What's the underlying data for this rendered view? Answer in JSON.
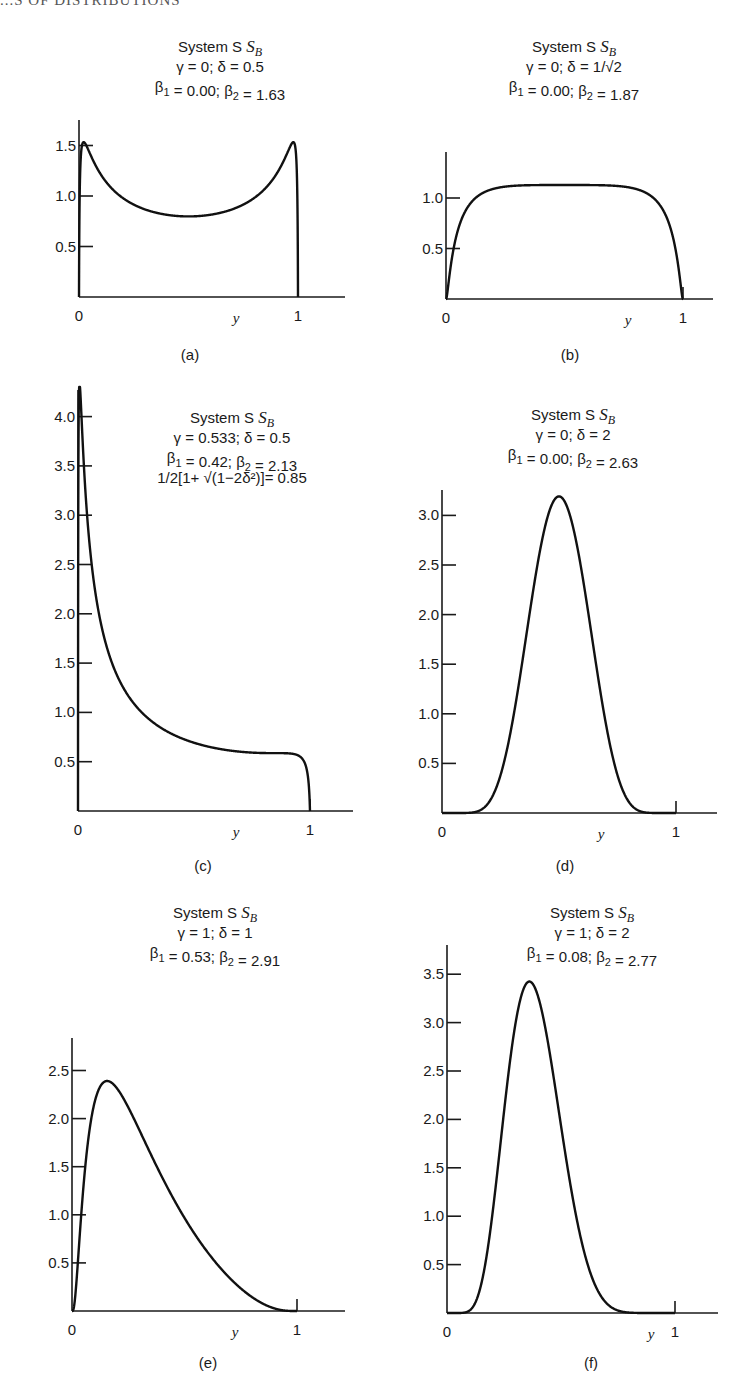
{
  "page": {
    "header_fragment": "...S OF DISTRIBUTIONS",
    "footer_fragment": ""
  },
  "chart_data": [
    {
      "id": "a",
      "type": "line",
      "caption": "(a)",
      "title": "System S_B",
      "title_lines": [
        "System S",
        "γ = 0; δ = 0.5",
        "β1 = 0.00; β2 = 1.63"
      ],
      "params": {
        "gamma": 0,
        "delta": 0.5,
        "beta1": 0.0,
        "beta2": 1.63
      },
      "xlabel": "y",
      "ylabel": "",
      "xlim": [
        0,
        1
      ],
      "ylim": [
        0,
        1.65
      ],
      "x_ticks": [
        "0",
        "1"
      ],
      "y_ticks": [
        0.5,
        1.0,
        1.5
      ],
      "y_tick_labels": [
        "0.5",
        "1.0",
        "1.5"
      ],
      "x": [
        0.1,
        0.2,
        0.3,
        0.4,
        0.5,
        0.6,
        0.7,
        0.8,
        0.9
      ],
      "values": [
        1.21,
        0.98,
        0.87,
        0.81,
        0.8,
        0.81,
        0.87,
        0.98,
        1.21
      ],
      "peak_values": [
        1.57,
        1.57
      ],
      "grid": false,
      "legend": null
    },
    {
      "id": "b",
      "type": "line",
      "caption": "(b)",
      "title": "System S_B",
      "title_lines": [
        "System S",
        "γ = 0; δ = 1/√2",
        "β1 = 0.00; β2 = 1.87"
      ],
      "params": {
        "gamma": 0,
        "delta": 0.7071,
        "beta1": 0.0,
        "beta2": 1.87
      },
      "xlabel": "y",
      "ylabel": "",
      "xlim": [
        0,
        1
      ],
      "ylim": [
        0,
        1.45
      ],
      "x_ticks": [
        "0",
        "1"
      ],
      "y_ticks": [
        0.5,
        1.0
      ],
      "y_tick_labels": [
        "0.5",
        "1.0"
      ],
      "x": [
        0.1,
        0.2,
        0.3,
        0.4,
        0.5,
        0.6,
        0.7,
        0.8,
        0.9
      ],
      "values": [
        0.94,
        1.09,
        1.12,
        1.13,
        1.13,
        1.13,
        1.12,
        1.09,
        0.94
      ],
      "grid": false,
      "legend": null
    },
    {
      "id": "c",
      "type": "line",
      "caption": "(c)",
      "title": "System S_B",
      "title_lines": [
        "System S",
        "γ = 0.533; δ = 0.5",
        "β1 = 0.42; β2 = 2.13",
        "1/2[1+ √(1−2δ²)]= 0.85"
      ],
      "params": {
        "gamma": 0.533,
        "delta": 0.5,
        "beta1": 0.42,
        "beta2": 2.13,
        "mode_expr": "1/2[1+ √(1−2δ²)]",
        "mode_value": 0.85
      },
      "xlabel": "y",
      "ylabel": "",
      "xlim": [
        0,
        1
      ],
      "ylim": [
        0,
        4.3
      ],
      "x_ticks": [
        "0",
        "1"
      ],
      "y_ticks": [
        0.5,
        1.0,
        1.5,
        2.0,
        2.5,
        3.0,
        3.5,
        4.0
      ],
      "y_tick_labels": [
        "0.5",
        "1.0",
        "1.5",
        "2.0",
        "2.5",
        "3.0",
        "3.5",
        "4.0"
      ],
      "x": [
        0.1,
        0.2,
        0.3,
        0.4,
        0.5,
        0.6,
        0.7,
        0.8,
        0.9
      ],
      "values": [
        1.89,
        1.23,
        0.94,
        0.79,
        0.69,
        0.63,
        0.6,
        0.59,
        0.57
      ],
      "peak": {
        "x": 0.04,
        "y": 4.03
      },
      "grid": false,
      "legend": null
    },
    {
      "id": "d",
      "type": "line",
      "caption": "(d)",
      "title": "System S_B",
      "title_lines": [
        "System S",
        "γ = 0; δ =  2",
        "β1 = 0.00; β2 = 2.63"
      ],
      "params": {
        "gamma": 0,
        "delta": 2,
        "beta1": 0.0,
        "beta2": 2.63
      },
      "xlabel": "y",
      "ylabel": "",
      "xlim": [
        0,
        1
      ],
      "ylim": [
        0,
        3.3
      ],
      "x_ticks": [
        "0",
        "1"
      ],
      "y_ticks": [
        0.5,
        1.0,
        1.5,
        2.0,
        2.5,
        3.0
      ],
      "y_tick_labels": [
        "0.5",
        "1.0",
        "1.5",
        "2.0",
        "2.5",
        "3.0"
      ],
      "x": [
        0.1,
        0.2,
        0.3,
        0.4,
        0.5,
        0.6,
        0.7,
        0.8,
        0.9
      ],
      "values": [
        0.0,
        0.11,
        0.9,
        2.39,
        3.19,
        2.39,
        0.9,
        0.11,
        0.0
      ],
      "peak": {
        "x": 0.5,
        "y": 3.19
      },
      "grid": false,
      "legend": null
    },
    {
      "id": "e",
      "type": "line",
      "caption": "(e)",
      "title": "System S_B",
      "title_lines": [
        "System S",
        "γ = 1; δ = 1",
        "β1 = 0.53; β2 = 2.91"
      ],
      "params": {
        "gamma": 1,
        "delta": 1,
        "beta1": 0.53,
        "beta2": 2.91
      },
      "xlabel": "y",
      "ylabel": "",
      "xlim": [
        0,
        1
      ],
      "ylim": [
        0,
        2.85
      ],
      "x_ticks": [
        "0",
        "1"
      ],
      "y_ticks": [
        0.5,
        1.0,
        1.5,
        2.0,
        2.5
      ],
      "y_tick_labels": [
        "0.5",
        "1.0",
        "1.5",
        "2.0",
        "2.5"
      ],
      "x": [
        0.1,
        0.2,
        0.3,
        0.4,
        0.5,
        0.6,
        0.7,
        0.8,
        0.9
      ],
      "values": [
        2.16,
        2.31,
        1.88,
        1.39,
        0.97,
        0.62,
        0.35,
        0.14,
        0.03
      ],
      "peak": {
        "x": 0.16,
        "y": 2.26
      },
      "grid": false,
      "legend": null
    },
    {
      "id": "f",
      "type": "line",
      "caption": "(f)",
      "title": "System S_B",
      "title_lines": [
        "System S",
        "γ = 1; δ = 2",
        "β1 = 0.08; β2 = 2.77"
      ],
      "params": {
        "gamma": 1,
        "delta": 2,
        "beta1": 0.08,
        "beta2": 2.77
      },
      "xlabel": "y",
      "ylabel": "",
      "xlim": [
        0,
        1
      ],
      "ylim": [
        0,
        3.8
      ],
      "x_ticks": [
        "0",
        "1"
      ],
      "y_ticks": [
        0.5,
        1.0,
        1.5,
        2.0,
        2.5,
        3.0,
        3.5
      ],
      "y_tick_labels": [
        "0.5",
        "1.0",
        "1.5",
        "2.0",
        "2.5",
        "3.0",
        "3.5"
      ],
      "x": [
        0.1,
        0.2,
        0.3,
        0.4,
        0.5,
        0.6,
        0.7,
        0.8,
        0.9
      ],
      "values": [
        0.03,
        1.04,
        2.99,
        3.27,
        1.94,
        0.65,
        0.1,
        0.0,
        0.0
      ],
      "peak": {
        "x": 0.37,
        "y": 3.39
      },
      "grid": false,
      "legend": null
    }
  ],
  "layout": {
    "panels": [
      {
        "x0": 79,
        "x1": 298,
        "xend": 345,
        "base": 297,
        "pxPerUnit": 101,
        "ytop": 120,
        "titleX": 220,
        "titleY": 52,
        "capX": 190,
        "capY": 360,
        "yLblX": 236
      },
      {
        "x0": 446,
        "x1": 683,
        "xend": 713,
        "base": 299,
        "pxPerUnit": 101,
        "ytop": 152,
        "titleX": 574,
        "titleY": 52,
        "capX": 570,
        "capY": 360,
        "yLblX": 628
      },
      {
        "x0": 78,
        "x1": 310,
        "xend": 353,
        "base": 811,
        "pxPerUnit": 98.6,
        "ytop": 390,
        "titleX": 232,
        "titleY": 423,
        "capX": 203,
        "capY": 871,
        "yLblX": 236
      },
      {
        "x0": 442,
        "x1": 676,
        "xend": 717,
        "base": 813,
        "pxPerUnit": 99.2,
        "ytop": 490,
        "titleX": 573,
        "titleY": 420,
        "capX": 565,
        "capY": 871,
        "yLblX": 601
      },
      {
        "x0": 72,
        "x1": 297,
        "xend": 345,
        "base": 1311,
        "pxPerUnit": 96.2,
        "ytop": 1038,
        "titleX": 215,
        "titleY": 918,
        "capX": 208,
        "capY": 1368,
        "yLblX": 235
      },
      {
        "x0": 447,
        "x1": 675,
        "xend": 718,
        "base": 1313,
        "pxPerUnit": 96.8,
        "ytop": 945,
        "titleX": 592,
        "titleY": 918,
        "capX": 591,
        "capY": 1368,
        "yLblX": 651
      }
    ]
  }
}
